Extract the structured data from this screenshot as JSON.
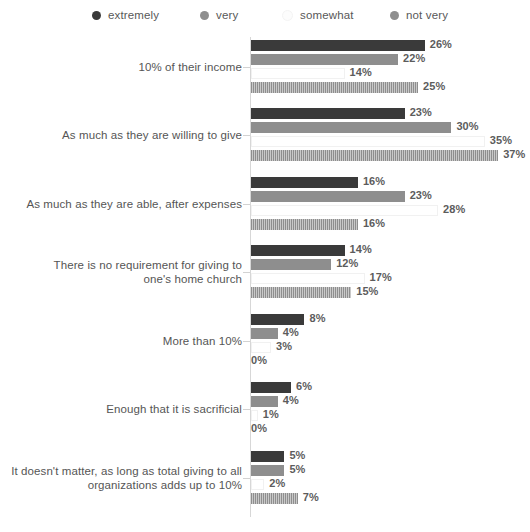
{
  "legend": {
    "items": [
      {
        "label": "extremely",
        "color": "#3a3a3a",
        "x": 92
      },
      {
        "label": "very",
        "color": "#8e8e8e",
        "x": 200
      },
      {
        "label": "somewhat",
        "color": "#fcfcfc",
        "x": 282
      },
      {
        "label": "not very",
        "color": "#8e8e8e",
        "x": 390
      }
    ]
  },
  "chart_data": {
    "type": "bar",
    "orientation": "horizontal",
    "title": "",
    "xlabel": "",
    "ylabel": "",
    "grid": false,
    "legend_position": "top",
    "xlim": [
      0,
      37
    ],
    "value_suffix": "%",
    "categories": [
      "10% of their income",
      "As much as they are willing to give",
      "As much as they are able, after expenses",
      "There is no requirement for giving to\none's home church",
      "More than 10%",
      "Enough that it is sacrificial",
      "It doesn't matter, as long as total giving to all\norganizations adds up to 10%"
    ],
    "series": [
      {
        "name": "extremely",
        "color": "#3a3a3a",
        "style": "solid",
        "values": [
          26,
          23,
          16,
          14,
          8,
          6,
          5
        ]
      },
      {
        "name": "very",
        "color": "#8e8e8e",
        "style": "solid",
        "values": [
          22,
          30,
          23,
          12,
          4,
          4,
          5
        ]
      },
      {
        "name": "somewhat",
        "color": "#ffffff",
        "style": "hollow",
        "values": [
          14,
          35,
          28,
          17,
          3,
          1,
          2
        ]
      },
      {
        "name": "not very",
        "color": "#8e8e8e",
        "style": "striped",
        "values": [
          25,
          37,
          16,
          15,
          0,
          0,
          7
        ]
      }
    ],
    "value_labels": [
      [
        "26%",
        "22%",
        "14%",
        "25%"
      ],
      [
        "23%",
        "30%",
        "35%",
        "37%"
      ],
      [
        "16%",
        "23%",
        "28%",
        "16%"
      ],
      [
        "14%",
        "12%",
        "17%",
        "15%"
      ],
      [
        "8%",
        "4%",
        "3%",
        "0%"
      ],
      [
        "6%",
        "4%",
        "1%",
        "0%"
      ],
      [
        "5%",
        "5%",
        "2%",
        "7%"
      ]
    ]
  }
}
